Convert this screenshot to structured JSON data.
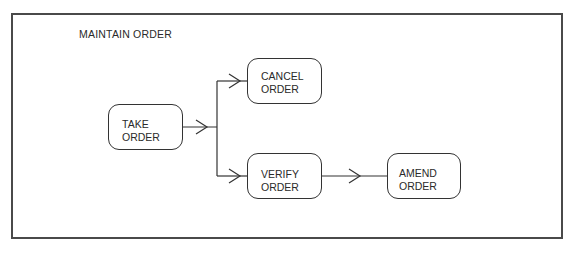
{
  "diagram": {
    "title": "MAINTAIN ORDER",
    "nodes": [
      {
        "id": "take",
        "line1": "TAKE",
        "line2": "ORDER"
      },
      {
        "id": "cancel",
        "line1": "CANCEL",
        "line2": "ORDER"
      },
      {
        "id": "verify",
        "line1": "VERIFY",
        "line2": "ORDER"
      },
      {
        "id": "amend",
        "line1": "AMEND",
        "line2": "ORDER"
      }
    ],
    "edges": [
      {
        "from": "take",
        "to": "cancel"
      },
      {
        "from": "take",
        "to": "verify"
      },
      {
        "from": "verify",
        "to": "amend"
      }
    ]
  }
}
